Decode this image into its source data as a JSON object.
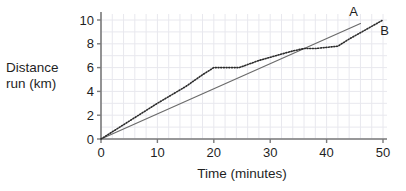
{
  "chart_data": {
    "type": "line",
    "title": "",
    "subtitle": "",
    "xlabel": "Time (minutes)",
    "ylabel": "Distance run (km)",
    "ylabel_line1": "Distance",
    "ylabel_line2": "run (km)",
    "xlim": [
      0,
      50
    ],
    "ylim": [
      0,
      10
    ],
    "xticks": [
      0,
      10,
      20,
      30,
      40,
      50
    ],
    "yticks": [
      0,
      2,
      4,
      6,
      8,
      10
    ],
    "xticklabels": [
      "0",
      "10",
      "20",
      "30",
      "40",
      "50"
    ],
    "yticklabels": [
      "0",
      "2",
      "4",
      "6",
      "8",
      "10"
    ],
    "grid": true,
    "grid_minor_spacing_x": 2,
    "grid_minor_spacing_y": 1,
    "legend": "inline-annotations",
    "colors": {
      "line_a": "#6b6b6b",
      "line_b": "#2b2b2b",
      "axis": "#7a7a7a",
      "grid": "#e8e8ee",
      "text": "#1f1f1f",
      "background": "#ffffff"
    },
    "series": [
      {
        "name": "A",
        "label": "A",
        "style": "solid",
        "annotation_at": {
          "x": 44.0,
          "y": 10.3
        },
        "points": [
          {
            "x": 0,
            "y": 0
          },
          {
            "x": 46,
            "y": 9.7
          }
        ]
      },
      {
        "name": "B",
        "label": "B",
        "style": "dotted",
        "annotation_at": {
          "x": 49.5,
          "y": 8.7
        },
        "points": [
          {
            "x": 0,
            "y": 0
          },
          {
            "x": 2,
            "y": 0.6
          },
          {
            "x": 5,
            "y": 1.5
          },
          {
            "x": 10,
            "y": 3.0
          },
          {
            "x": 15,
            "y": 4.4
          },
          {
            "x": 18,
            "y": 5.4
          },
          {
            "x": 20,
            "y": 6.0
          },
          {
            "x": 22,
            "y": 6.0
          },
          {
            "x": 24.5,
            "y": 6.0
          },
          {
            "x": 28,
            "y": 6.6
          },
          {
            "x": 31,
            "y": 7.0
          },
          {
            "x": 34,
            "y": 7.4
          },
          {
            "x": 36,
            "y": 7.6
          },
          {
            "x": 38,
            "y": 7.6
          },
          {
            "x": 40,
            "y": 7.7
          },
          {
            "x": 42,
            "y": 7.8
          },
          {
            "x": 44,
            "y": 8.4
          },
          {
            "x": 47,
            "y": 9.2
          },
          {
            "x": 50,
            "y": 10.0
          }
        ]
      }
    ],
    "annotations": [
      {
        "text": "A",
        "x": 44.0,
        "y": 10.3
      },
      {
        "text": "B",
        "x": 49.5,
        "y": 8.7
      }
    ]
  }
}
